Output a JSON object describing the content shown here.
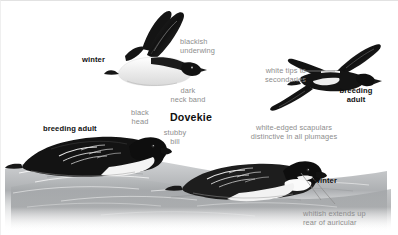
{
  "plate": {
    "title": "Dovekie",
    "palette": {
      "label_gray": "#8d8d8d",
      "bold_black": "#111111",
      "plumage_black": "#1a1a1a",
      "water_gray": "#8e9093",
      "paper": "#ffffff"
    },
    "figures": [
      {
        "id": "flying-winter",
        "name": "winter-flying-dovekie",
        "label": "winter",
        "pose": "in flight, underside, wings raised",
        "plumage": "winter"
      },
      {
        "id": "flying-breeding",
        "name": "breeding-adult-flying-dovekie",
        "label": "breeding\nadult",
        "pose": "in flight, upperside, wings spread",
        "plumage": "breeding adult"
      },
      {
        "id": "swimming-breeding",
        "name": "breeding-adult-swimming-dovekie",
        "label": "breeding adult",
        "pose": "swimming on water, facing right",
        "plumage": "breeding adult"
      },
      {
        "id": "swimming-winter",
        "name": "winter-swimming-dovekie",
        "label": "winter",
        "pose": "swimming on water, facing right",
        "plumage": "winter"
      }
    ],
    "annotations": [
      {
        "id": "blackish-underwing",
        "text": "blackish\nunderwing",
        "leader": false
      },
      {
        "id": "dark-neck-band",
        "text": "dark\nneck band",
        "leader": false
      },
      {
        "id": "white-tips-secondaries",
        "text": "white tips to\nsecondaries",
        "leader": true
      },
      {
        "id": "black-head",
        "text": "black\nhead",
        "leader": false
      },
      {
        "id": "stubby-bill",
        "text": "stubby\nbill",
        "leader": false
      },
      {
        "id": "white-edged-scapulars",
        "text": "white-edged scapulars\ndistinctive in all plumages",
        "leader": false
      },
      {
        "id": "whitish-auricular",
        "text": "whitish extends up\nrear of auricular",
        "leader": true
      }
    ]
  }
}
